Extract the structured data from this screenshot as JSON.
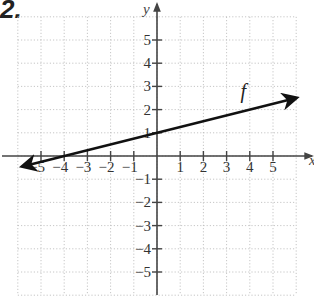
{
  "problem": {
    "number": "2."
  },
  "chart_data": {
    "type": "line",
    "title": "",
    "xlabel": "x",
    "ylabel": "y",
    "xlim": [
      -6,
      6
    ],
    "ylim": [
      -6,
      6
    ],
    "grid": true,
    "grid_style": "dotted",
    "x_tick_labels": [
      "-5",
      "-4",
      "-3",
      "-2",
      "-1",
      "1",
      "2",
      "3",
      "4",
      "5"
    ],
    "y_tick_labels": [
      "5",
      "4",
      "3",
      "2",
      "1",
      "-1",
      "-2",
      "-3",
      "-4",
      "-5"
    ],
    "series": [
      {
        "name": "f",
        "equation": "f(x) = x/4 + 1",
        "points": [
          [
            -4,
            0
          ],
          [
            0,
            1
          ],
          [
            4,
            2
          ]
        ],
        "x_range": [
          -5.8,
          6.0
        ],
        "arrows": "both",
        "color": "#111111"
      }
    ],
    "annotations": [
      {
        "text": "f",
        "x": 3.6,
        "y": 2.5
      }
    ]
  }
}
